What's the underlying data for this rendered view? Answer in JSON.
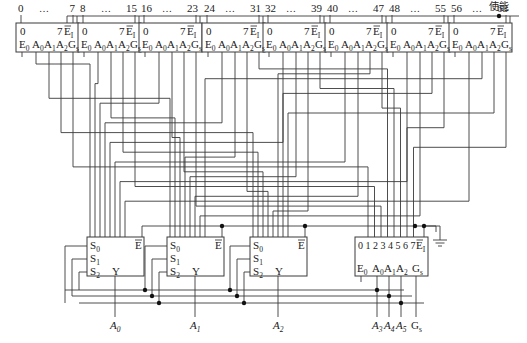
{
  "diagram": {
    "enable_label": "使能",
    "top_decoders": [
      {
        "range_start": "0",
        "range_end": "7",
        "ellipsis": "…",
        "out_first": "0",
        "out_last": "7",
        "enable": "E",
        "enable_sub": "I",
        "inputs": [
          "E0",
          "A0",
          "A1",
          "A2",
          "Gs"
        ]
      },
      {
        "range_start": "8",
        "range_end": "15",
        "ellipsis": "…",
        "out_first": "0",
        "out_last": "7",
        "enable": "E",
        "enable_sub": "I",
        "inputs": [
          "E0",
          "A0",
          "A1",
          "A2",
          "Gs"
        ]
      },
      {
        "range_start": "16",
        "range_end": "23",
        "ellipsis": "…",
        "out_first": "0",
        "out_last": "7",
        "enable": "E",
        "enable_sub": "I",
        "inputs": [
          "E0",
          "A0",
          "A1",
          "A2",
          "Gs"
        ]
      },
      {
        "range_start": "24",
        "range_end": "31",
        "ellipsis": "…",
        "out_first": "0",
        "out_last": "7",
        "enable": "E",
        "enable_sub": "I",
        "inputs": [
          "E0",
          "A0",
          "A1",
          "A2",
          "Gs"
        ]
      },
      {
        "range_start": "32",
        "range_end": "39",
        "ellipsis": "…",
        "out_first": "0",
        "out_last": "7",
        "enable": "E",
        "enable_sub": "I",
        "inputs": [
          "E0",
          "A0",
          "A1",
          "A2",
          "Gs"
        ]
      },
      {
        "range_start": "40",
        "range_end": "47",
        "ellipsis": "…",
        "out_first": "0",
        "out_last": "7",
        "enable": "E",
        "enable_sub": "I",
        "inputs": [
          "E0",
          "A0",
          "A1",
          "A2",
          "Gs"
        ]
      },
      {
        "range_start": "48",
        "range_end": "55",
        "ellipsis": "…",
        "out_first": "0",
        "out_last": "7",
        "enable": "E",
        "enable_sub": "I",
        "inputs": [
          "E0",
          "A0",
          "A1",
          "A2",
          "Gs"
        ]
      },
      {
        "range_start": "56",
        "range_end": "63",
        "ellipsis": "…",
        "out_first": "0",
        "out_last": "7",
        "enable": "E",
        "enable_sub": "I",
        "inputs": [
          "E0",
          "A0",
          "A1",
          "A2",
          "Gs"
        ]
      }
    ],
    "muxes": [
      {
        "s0": "S0",
        "s1": "S1",
        "s2": "S2",
        "y": "Y",
        "e": "E",
        "output": "A0"
      },
      {
        "s0": "S0",
        "s1": "S1",
        "s2": "S2",
        "y": "Y",
        "e": "E",
        "output": "A1"
      },
      {
        "s0": "S0",
        "s1": "S1",
        "s2": "S2",
        "y": "Y",
        "e": "E",
        "output": "A2"
      }
    ],
    "priority_encoder": {
      "inputs_label": "0 1 2 3 4 5 6 7",
      "enable": "E",
      "enable_sub": "I",
      "outputs": [
        "E0",
        "A0",
        "A1",
        "A2",
        "Gs"
      ],
      "output_labels": [
        "A3",
        "A4",
        "A5",
        "Gs"
      ]
    }
  }
}
